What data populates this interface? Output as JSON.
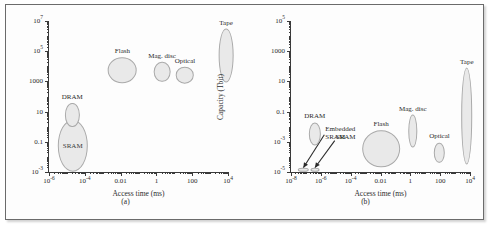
{
  "figure": {
    "panels": [
      {
        "caption": "(a)",
        "xlabel": "Access time (ms)",
        "ylabel": "Capacity (Mbit)"
      },
      {
        "caption": "(b)",
        "xlabel": "Access time (ms)",
        "ylabel": "Capacity (Tbit)"
      }
    ]
  },
  "chart_data": [
    {
      "type": "scatter",
      "title": "",
      "panel": "(a)",
      "xlabel": "Access time (ms)",
      "ylabel": "Capacity (Mbit)",
      "xscale": "log",
      "yscale": "log",
      "xlim": [
        1e-06,
        10000.0
      ],
      "ylim": [
        0.001,
        10000000.0
      ],
      "grid": false,
      "legend": "none",
      "xticks": [
        {
          "value": 1e-06,
          "label": "10",
          "exp": "-6"
        },
        {
          "value": 0.0001,
          "label": "10",
          "exp": "-4"
        },
        {
          "value": 0.01,
          "label": "0.01",
          "exp": ""
        },
        {
          "value": 1,
          "label": "1",
          "exp": ""
        },
        {
          "value": 100,
          "label": "100",
          "exp": ""
        },
        {
          "value": 10000,
          "label": "10",
          "exp": "4"
        }
      ],
      "yticks": [
        {
          "value": 0.001,
          "label": "10",
          "exp": "-3"
        },
        {
          "value": 0.1,
          "label": "0.1",
          "exp": ""
        },
        {
          "value": 10,
          "label": "10",
          "exp": ""
        },
        {
          "value": 1000,
          "label": "1000",
          "exp": ""
        },
        {
          "value": 100000.0,
          "label": "10",
          "exp": "5"
        },
        {
          "value": 10000000.0,
          "label": "10",
          "exp": "7"
        }
      ],
      "regions": [
        {
          "name": "SRAM",
          "label": "SRAM",
          "label_pos": "inside",
          "x_center": 2e-05,
          "y_center": 0.08,
          "x_span": [
            3e-06,
            0.00015
          ],
          "y_span": [
            0.001,
            3
          ]
        },
        {
          "name": "DRAM",
          "label": "DRAM",
          "label_pos": "above",
          "x_center": 2e-05,
          "y_center": 8,
          "x_span": [
            8e-06,
            5e-05
          ],
          "y_span": [
            1,
            40
          ]
        },
        {
          "name": "Flash",
          "label": "Flash",
          "label_pos": "above",
          "x_center": 0.012,
          "y_center": 5000,
          "x_span": [
            0.002,
            0.08
          ],
          "y_span": [
            800,
            40000.0
          ]
        },
        {
          "name": "Mag. disc",
          "label": "Mag. disc",
          "label_pos": "above",
          "x_center": 2.0,
          "y_center": 4000,
          "x_span": [
            0.7,
            6
          ],
          "y_span": [
            900,
            20000.0
          ]
        },
        {
          "name": "Optical",
          "label": "Optical",
          "label_pos": "above",
          "x_center": 40,
          "y_center": 2500,
          "x_span": [
            12,
            130
          ],
          "y_span": [
            700,
            9000
          ]
        },
        {
          "name": "Tape",
          "label": "Tape",
          "label_pos": "above",
          "x_center": 8000,
          "y_center": 60000.0,
          "x_span": [
            3000,
            20000.0
          ],
          "y_span": [
            900,
            3000000.0
          ]
        }
      ]
    },
    {
      "type": "scatter",
      "title": "",
      "panel": "(b)",
      "xlabel": "Access time (ms)",
      "ylabel": "Capacity (Tbit)",
      "xscale": "log",
      "yscale": "log",
      "xlim": [
        1e-08,
        10000.0
      ],
      "ylim": [
        1e-05,
        100000.0
      ],
      "grid": false,
      "legend": "none",
      "xticks": [
        {
          "value": 1e-08,
          "label": "10",
          "exp": "-8"
        },
        {
          "value": 1e-06,
          "label": "10",
          "exp": "-6"
        },
        {
          "value": 0.0001,
          "label": "10",
          "exp": "-4"
        },
        {
          "value": 0.01,
          "label": "0.01",
          "exp": ""
        },
        {
          "value": 1,
          "label": "1",
          "exp": ""
        },
        {
          "value": 100,
          "label": "100",
          "exp": ""
        },
        {
          "value": 10000,
          "label": "10",
          "exp": "4"
        }
      ],
      "yticks": [
        {
          "value": 1e-05,
          "label": "10",
          "exp": "-5"
        },
        {
          "value": 0.001,
          "label": "10",
          "exp": "-3"
        },
        {
          "value": 0.1,
          "label": "0.1",
          "exp": ""
        },
        {
          "value": 10,
          "label": "10",
          "exp": ""
        },
        {
          "value": 1000,
          "label": "1000",
          "exp": ""
        },
        {
          "value": 100000.0,
          "label": "10",
          "exp": "5"
        }
      ],
      "regions": [
        {
          "name": "DRAM",
          "label": "DRAM",
          "label_pos": "above",
          "x_center": 4e-07,
          "y_center": 0.003,
          "x_span": [
            1.5e-07,
            1e-06
          ],
          "y_span": [
            0.0006,
            0.02
          ]
        },
        {
          "name": "Flash",
          "label": "Flash",
          "label_pos": "above",
          "x_center": 0.01,
          "y_center": 0.0004,
          "x_span": [
            0.0006,
            0.2
          ],
          "y_span": [
            2e-05,
            0.006
          ]
        },
        {
          "name": "Mag. disc",
          "label": "Mag. disc",
          "label_pos": "above",
          "x_center": 1.5,
          "y_center": 0.005,
          "x_span": [
            0.7,
            3
          ],
          "y_span": [
            0.0004,
            0.06
          ]
        },
        {
          "name": "Optical",
          "label": "Optical",
          "label_pos": "above",
          "x_center": 90,
          "y_center": 0.0002,
          "x_span": [
            40,
            200
          ],
          "y_span": [
            4e-05,
            0.0009
          ]
        },
        {
          "name": "Tape",
          "label": "Tape",
          "label_pos": "above",
          "x_center": 6000,
          "y_center": 0.06,
          "x_span": [
            2500,
            15000.0
          ],
          "y_span": [
            3e-05,
            80
          ]
        },
        {
          "name": "Embedded SRAM",
          "label": "Embedded SRAM",
          "label_pos": "callout",
          "x_center": 6e-08,
          "y_center": 1.5e-05,
          "x_span": [
            3e-08,
            1.5e-07
          ],
          "y_span": [
            1e-05,
            2e-05
          ]
        },
        {
          "name": "SRAM",
          "label": "SRAM",
          "label_pos": "callout",
          "x_center": 4e-07,
          "y_center": 1.5e-05,
          "x_span": [
            2e-07,
            8e-07
          ],
          "y_span": [
            1e-05,
            2e-05
          ]
        }
      ],
      "callouts": [
        {
          "text_line1": "Embedded",
          "text_line2": "SRAM",
          "target": "Embedded SRAM"
        },
        {
          "text_line1": "SRAM",
          "text_line2": "",
          "target": "SRAM"
        }
      ]
    }
  ],
  "colors": {
    "blob_fill": "#e9e9e9",
    "blob_stroke": "#a9a9a9",
    "axis": "#3a3a3a",
    "frame": "#6b6b6b",
    "text": "#2b2b2b",
    "background": "#fdfdfd"
  }
}
